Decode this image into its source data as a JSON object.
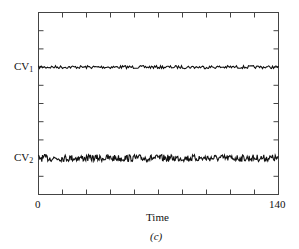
{
  "chart_data": {
    "type": "line",
    "title": "",
    "panel_label": "(c)",
    "xlabel": "Time",
    "ylabel": "",
    "xlim": [
      0,
      140
    ],
    "x_tick_labels": [
      "0",
      "140"
    ],
    "x_minor_ticks": 10,
    "y_ticks_count": 10,
    "grid": false,
    "legend": null,
    "series": [
      {
        "name": "CV1",
        "label_main": "CV",
        "label_sub": "1",
        "mean_level": 0.7,
        "noise_amplitude": "small",
        "description": "noisy flat trace near constant level"
      },
      {
        "name": "CV2",
        "label_main": "CV",
        "label_sub": "2",
        "mean_level": 0.2,
        "noise_amplitude": "larger",
        "description": "noisy flat trace near constant level, more variable than CV1"
      }
    ],
    "colors": {
      "line": "#111111",
      "axes": "#444444"
    }
  },
  "labels": {
    "x_min": "0",
    "x_max": "140",
    "x_axis_title": "Time",
    "panel": "(c)",
    "cv1_main": "CV",
    "cv1_sub": "1",
    "cv2_main": "CV",
    "cv2_sub": "2"
  }
}
